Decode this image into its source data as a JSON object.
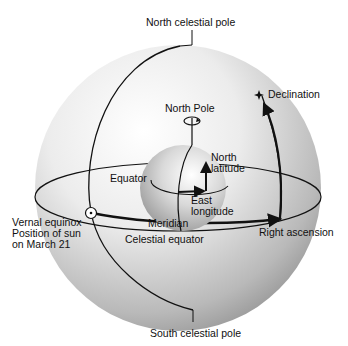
{
  "labels": {
    "north_celestial_pole": "North celestial pole",
    "south_celestial_pole": "South celestial pole",
    "declination": "Declination",
    "north_pole": "North Pole",
    "north_latitude_1": "North",
    "north_latitude_2": "latitude",
    "equator": "Equator",
    "east_longitude_1": "East",
    "east_longitude_2": "longitude",
    "meridian": "Meridian",
    "celestial_equator": "Celestial equator",
    "right_ascension": "Right ascension",
    "vernal_1": "Vernal equinox",
    "vernal_2": "Position of sun",
    "vernal_3": "on March 21"
  },
  "icons": {
    "star": "star-icon",
    "sun": "sun-symbol-icon",
    "rotation": "rotation-arrow-icon"
  }
}
